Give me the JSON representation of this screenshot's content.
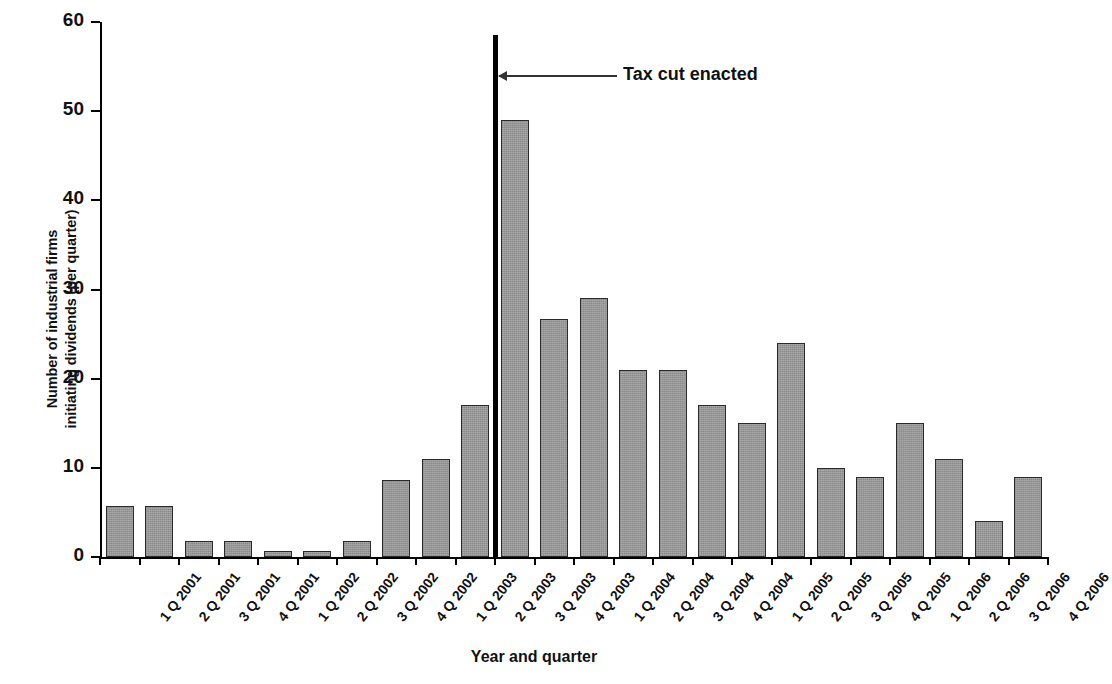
{
  "chart_data": {
    "type": "bar",
    "title": "",
    "xlabel": "Year and quarter",
    "ylabel_line1": "Number of industrial firms",
    "ylabel_line2": "initiating dividends (per quarter)",
    "categories": [
      "1 Q 2001",
      "2 Q 2001",
      "3 Q 2001",
      "4 Q 2001",
      "1 Q 2002",
      "2 Q 2002",
      "3 Q 2002",
      "4 Q 2002",
      "1 Q 2003",
      "2 Q 2003",
      "3 Q 2003",
      "4 Q 2003",
      "1 Q 2004",
      "2 Q 2004",
      "3 Q 2004",
      "4 Q 2004",
      "1 Q 2005",
      "2 Q 2005",
      "3 Q 2005",
      "4 Q 2005",
      "1 Q 2006",
      "2 Q 2006",
      "3 Q 2006",
      "4 Q 2006"
    ],
    "values": [
      5.7,
      5.7,
      1.8,
      1.8,
      0.7,
      0.7,
      1.8,
      8.6,
      11,
      17,
      49,
      26.7,
      29,
      21,
      21,
      17,
      15,
      24,
      10,
      9,
      15,
      11,
      4,
      9
    ],
    "ylim": [
      0,
      60
    ],
    "yticks": [
      0,
      10,
      20,
      30,
      40,
      50,
      60
    ],
    "ytick_labels": [
      "0",
      "10",
      "20",
      "30",
      "40",
      "50",
      "60"
    ],
    "grid": false,
    "legend": "none",
    "bar_color": "#9d9d9d",
    "bar_edge_color": "#2a2a2a",
    "annotations": [
      {
        "name": "tax-cut-marker",
        "label": "Tax cut enacted",
        "value_at_category": "3 Q 2003",
        "line_top_value": 58.5,
        "marker_color": "#000000"
      }
    ]
  }
}
